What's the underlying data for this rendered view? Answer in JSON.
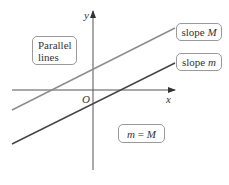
{
  "diagram": {
    "axes": {
      "x_label": "x",
      "y_label": "y",
      "origin_label": "O"
    },
    "lines": [
      {
        "name": "upper-line",
        "label_prefix": "slope ",
        "label_var": "M",
        "color": "#8c8c8c"
      },
      {
        "name": "lower-line",
        "label_prefix": "slope ",
        "label_var": "m",
        "color": "#454545"
      }
    ],
    "annotations": {
      "parallel_line1": "Parallel",
      "parallel_line2": "lines",
      "equation_left": "m",
      "equation_op": " = ",
      "equation_right": "M"
    },
    "colors": {
      "axis": "#555555",
      "box_border": "#9a9a9a"
    }
  }
}
